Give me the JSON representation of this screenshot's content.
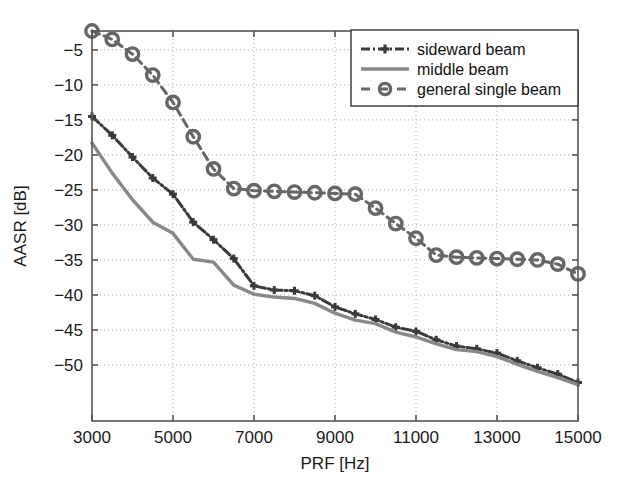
{
  "chart_data": {
    "type": "line",
    "title": "",
    "xlabel": "PRF [Hz]",
    "ylabel": "AASR [dB]",
    "xlim": [
      3000,
      15000
    ],
    "ylim": [
      -58,
      -2.3
    ],
    "xticks": [
      3000,
      5000,
      7000,
      9000,
      11000,
      13000,
      15000
    ],
    "xtick_labels": [
      "3000",
      "5000",
      "7000",
      "9000",
      "11000",
      "13000",
      "15000"
    ],
    "yticks": [
      -5,
      -10,
      -15,
      -20,
      -25,
      -30,
      -35,
      -40,
      -45,
      -50
    ],
    "ytick_labels": [
      "-5",
      "-10",
      "-15",
      "-20",
      "-25",
      "-30",
      "-35",
      "-40",
      "-45",
      "-50"
    ],
    "grid": true,
    "grid_style": "dotted",
    "legend_position": "top-right",
    "series": [
      {
        "name": "sideward beam",
        "style": "dash-dot",
        "marker": "plus",
        "color": "#3a3a3a",
        "x": [
          3000,
          3500,
          4000,
          4500,
          5000,
          5500,
          6000,
          6500,
          7000,
          7500,
          8000,
          8500,
          9000,
          9500,
          10000,
          10500,
          11000,
          11500,
          12000,
          12500,
          13000,
          13500,
          14000,
          14500,
          15000
        ],
        "y": [
          -14.5,
          -17.2,
          -20.3,
          -23.3,
          -25.6,
          -29.6,
          -32.1,
          -34.8,
          -38.7,
          -39.3,
          -39.4,
          -40.1,
          -41.7,
          -42.7,
          -43.5,
          -44.6,
          -45.2,
          -46.4,
          -47.3,
          -47.7,
          -48.3,
          -49.4,
          -50.4,
          -51.3,
          -52.5
        ]
      },
      {
        "name": "middle beam",
        "style": "solid",
        "marker": "none",
        "color": "#888888",
        "x": [
          3000,
          3500,
          4000,
          4500,
          5000,
          5500,
          6000,
          6500,
          7000,
          7500,
          8000,
          8500,
          9000,
          9500,
          10000,
          10500,
          11000,
          11500,
          12000,
          12500,
          13000,
          13500,
          14000,
          14500,
          15000
        ],
        "y": [
          -18.3,
          -22.6,
          -26.4,
          -29.6,
          -31.2,
          -34.9,
          -35.3,
          -38.6,
          -39.9,
          -40.3,
          -40.5,
          -41.2,
          -42.6,
          -43.6,
          -44.1,
          -45.3,
          -46.0,
          -47.0,
          -47.8,
          -48.1,
          -48.8,
          -49.9,
          -50.9,
          -51.8,
          -52.8
        ]
      },
      {
        "name": "general single beam",
        "style": "dashed",
        "marker": "circle",
        "color": "#666666",
        "x": [
          3000,
          3500,
          4000,
          4500,
          5000,
          5500,
          6000,
          6500,
          7000,
          7500,
          8000,
          8500,
          9000,
          9500,
          10000,
          10500,
          11000,
          11500,
          12000,
          12500,
          13000,
          13500,
          14000,
          14500,
          15000
        ],
        "y": [
          -2.3,
          -3.5,
          -5.6,
          -8.6,
          -12.5,
          -17.4,
          -22.0,
          -24.8,
          -25.1,
          -25.2,
          -25.3,
          -25.4,
          -25.5,
          -25.6,
          -27.6,
          -29.8,
          -31.9,
          -34.3,
          -34.6,
          -34.7,
          -34.8,
          -34.9,
          -35.0,
          -35.6,
          -37.0
        ]
      }
    ]
  },
  "legend": {
    "entries": [
      {
        "label": "sideward beam",
        "sample": "dash-dot-plus"
      },
      {
        "label": "middle beam",
        "sample": "solid-line"
      },
      {
        "label": "general single beam",
        "sample": "dashed-circle"
      }
    ]
  },
  "colors": {
    "axis": "#555555",
    "grid": "#aaaaaa",
    "sideward": "#3a3a3a",
    "middle": "#888888",
    "general": "#666666",
    "text": "#1a1a1a",
    "background": "#ffffff"
  }
}
